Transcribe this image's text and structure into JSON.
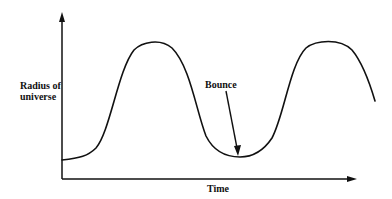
{
  "diagram": {
    "title": "",
    "y_axis_label": "Radius of universe",
    "y_axis_label_lines": [
      "Radius of",
      "universe"
    ],
    "x_axis_label": "Time",
    "annotation": "Bounce",
    "curve_description": "Oscillating radius of universe: rises to maximum, falls to a minimum (bounce), rises again",
    "colors": {
      "line": "#111111",
      "background": "#ffffff"
    }
  }
}
